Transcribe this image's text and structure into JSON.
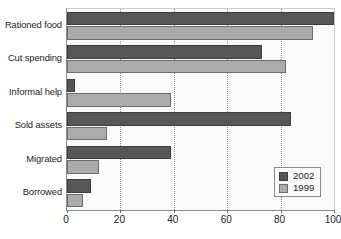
{
  "chart_data": {
    "type": "bar",
    "orientation": "horizontal",
    "title": "",
    "subtitle": "",
    "xlabel": "",
    "ylabel": "",
    "categories": [
      "Rationed food",
      "Cut spending",
      "Informal help",
      "Sold assets",
      "Migrated",
      "Borrowed"
    ],
    "series": [
      {
        "name": "2002",
        "color": "#575757",
        "values": [
          100,
          73,
          3,
          84,
          39,
          9
        ]
      },
      {
        "name": "1999",
        "color": "#ababab",
        "values": [
          92,
          82,
          39,
          15,
          12,
          6
        ]
      }
    ],
    "xlim": [
      0,
      100
    ],
    "xticks": [
      0,
      20,
      40,
      60,
      80,
      100
    ],
    "xtick_labels": [
      "0",
      "20",
      "40",
      "60",
      "80",
      "100"
    ],
    "gridlines": {
      "vertical": true,
      "horizontal": false,
      "style": "dotted"
    },
    "legend": {
      "position": "bottom-right",
      "entries": [
        {
          "label": "2002",
          "color": "#575757"
        },
        {
          "label": "1999",
          "color": "#ababab"
        }
      ]
    },
    "colors": {
      "series_2002": "#575757",
      "series_1999": "#ababab",
      "plot_background": "#fbfbfb",
      "axis": "#8a8a8a",
      "text": "#1c1c28",
      "grid": "#8f8f8f"
    }
  }
}
